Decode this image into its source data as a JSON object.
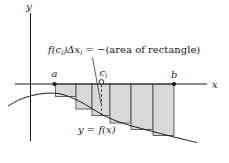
{
  "figure_labels": {
    "y_axis": "y",
    "x_axis": "x",
    "point_a": "a",
    "point_b": "b",
    "point_c_main": "c",
    "point_c_sub": "i",
    "curve_label": "y = f(x)"
  },
  "annotation": {
    "segments": [
      {
        "t": "f(c",
        "italic": true
      },
      {
        "t": "i",
        "italic": true,
        "sub": true
      },
      {
        "t": ")Δx",
        "italic": true
      },
      {
        "t": "i",
        "italic": true,
        "sub": true
      },
      {
        "t": " = −(area of rectangle)",
        "italic": false
      }
    ]
  },
  "geometry": {
    "x_axis": {
      "y": 84,
      "x1": 15,
      "x2": 207
    },
    "y_axis": {
      "x": 30.5,
      "y1": 13,
      "y2": 141
    },
    "point_a_x": 54.5,
    "point_b_x": 174,
    "c_i_x": 101.5,
    "rectangles": [
      {
        "x1": 55.5,
        "x2": 76,
        "bottom": 96.5
      },
      {
        "x1": 76,
        "x2": 92,
        "bottom": 109
      },
      {
        "x1": 92,
        "x2": 110,
        "bottom": 115.5
      },
      {
        "x1": 110,
        "x2": 131,
        "bottom": 123
      },
      {
        "x1": 131,
        "x2": 153,
        "bottom": 129.5
      },
      {
        "x1": 153,
        "x2": 174,
        "bottom": 135.5
      }
    ],
    "curve_points": [
      [
        8,
        106
      ],
      [
        20,
        99.5
      ],
      [
        33,
        95.3
      ],
      [
        46,
        93.2
      ],
      [
        58,
        93.5
      ],
      [
        68,
        96.2
      ],
      [
        80,
        101.5
      ],
      [
        91,
        108
      ],
      [
        103,
        115
      ],
      [
        116,
        120.8
      ],
      [
        132,
        126
      ],
      [
        150,
        130.8
      ],
      [
        166,
        135
      ],
      [
        182,
        139
      ],
      [
        197,
        142.5
      ]
    ],
    "dashed_line": {
      "x": 101.5,
      "y1": 84.5,
      "y2": 115.5
    },
    "leader_line": {
      "x1": 92.5,
      "y1": 57.5,
      "x2": 101,
      "y2": 104
    }
  },
  "colors": {
    "ink": "#1a1a1a",
    "rect_fill": "#d9d9d9",
    "rect_stroke": "#3f3f3f",
    "background": "#ffffff"
  }
}
